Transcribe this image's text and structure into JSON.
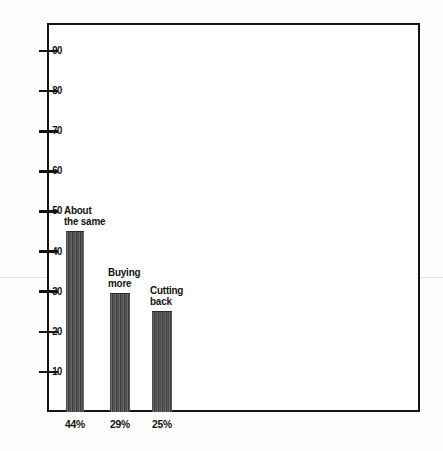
{
  "chart_data": {
    "type": "bar",
    "title": "",
    "subtitle": "",
    "xlabel": "",
    "ylabel": "",
    "ylim": [
      0,
      97
    ],
    "grid": false,
    "legend": "none",
    "categories": [
      "About the same",
      "Buying more",
      "Cutting back"
    ],
    "values": [
      45,
      29.5,
      25
    ],
    "bar_annotations": [
      {
        "line1": "About",
        "line2": "the same"
      },
      {
        "line1": "Buying",
        "line2": "more"
      },
      {
        "line1": "Cutting",
        "line2": "back"
      }
    ],
    "data_labels": [
      "44%",
      "29%",
      "25%"
    ],
    "y_ticks": [
      10,
      20,
      30,
      40,
      50,
      60,
      70,
      80,
      90
    ],
    "y_tick_labels": [
      "10",
      "20",
      "30",
      "40",
      "50",
      "60",
      "70",
      "80",
      "90"
    ],
    "colors": {
      "bar_fill": "#4b4b4b",
      "bar_hatch": "#6e6e6e",
      "axis": "#141414",
      "text": "#111111",
      "background": "#ffffff"
    }
  }
}
